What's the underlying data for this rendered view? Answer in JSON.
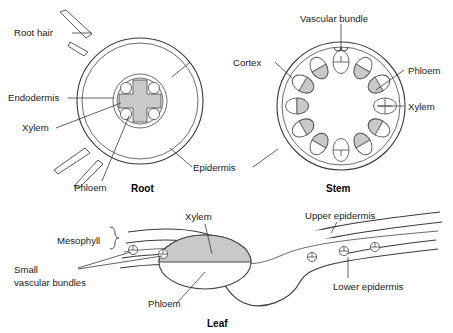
{
  "figure": {
    "colors": {
      "outline": "#3a3a3a",
      "tissue_fill": "#c9c9c9",
      "background": "#ffffff",
      "text": "#1a1a1a"
    }
  },
  "root": {
    "caption": "Root",
    "labels": {
      "root_hair": "Root hair",
      "endodermis": "Endodermis",
      "xylem": "Xylem",
      "phloem": "Phloem",
      "cortex": "Cortex",
      "epidermis": "Epidermis"
    },
    "structure": {
      "root_hairs": 4,
      "phloem_bundles": 4,
      "xylem_shape": "cross"
    }
  },
  "stem": {
    "caption": "Stem",
    "labels": {
      "vascular_bundle": "Vascular bundle",
      "phloem": "Phloem",
      "xylem": "Xylem",
      "cortex": "Cortex",
      "epidermis": "Epidermis"
    },
    "structure": {
      "vascular_bundles": 12,
      "arrangement": "ring"
    }
  },
  "leaf": {
    "caption": "Leaf",
    "labels": {
      "mesophyll": "Mesophyll",
      "small_vascular_bundles": "Small\nvascular bundles",
      "small_vascular_bundles_line1": "Small",
      "small_vascular_bundles_line2": "vascular bundles",
      "xylem": "Xylem",
      "phloem": "Phloem",
      "upper_epidermis": "Upper epidermis",
      "lower_epidermis": "Lower epidermis"
    },
    "structure": {
      "small_bundles_left": 2,
      "small_bundles_right": 3,
      "midrib": "large central ellipse, xylem above, phloem below"
    }
  }
}
